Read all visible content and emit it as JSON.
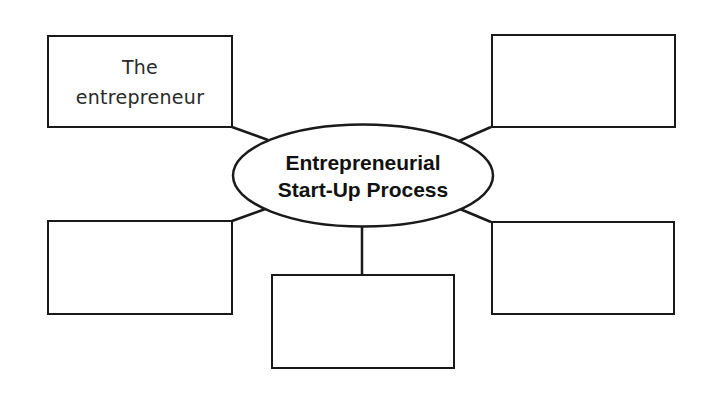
{
  "diagram": {
    "type": "concept-map",
    "center": {
      "lines": [
        "Entrepreneurial",
        "Start-Up Process"
      ]
    },
    "boxes": [
      {
        "position": "top-left",
        "lines": [
          "The",
          "entrepreneur"
        ]
      },
      {
        "position": "top-right",
        "lines": [
          "",
          ""
        ]
      },
      {
        "position": "bottom-left",
        "lines": [
          "",
          ""
        ]
      },
      {
        "position": "bottom-center",
        "lines": [
          "",
          ""
        ]
      },
      {
        "position": "bottom-right",
        "lines": [
          "",
          ""
        ]
      }
    ],
    "colors": {
      "stroke": "#1a1a1a",
      "background": "#ffffff",
      "text": "#111111"
    }
  }
}
